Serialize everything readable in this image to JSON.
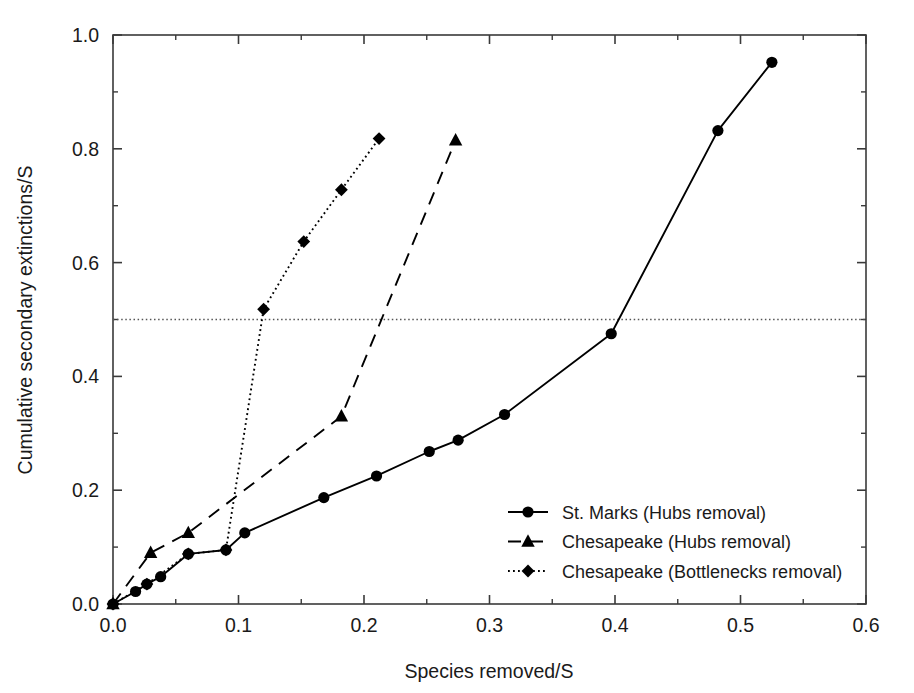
{
  "chart_data": {
    "type": "line",
    "title": "",
    "xlabel": "Species removed/S",
    "ylabel": "Cumulative secondary extinctions/S",
    "xlim": [
      0.0,
      0.6
    ],
    "ylim": [
      0.0,
      1.0
    ],
    "xticks": [
      "0.0",
      "0.1",
      "0.2",
      "0.3",
      "0.4",
      "0.5",
      "0.6"
    ],
    "xtick_values": [
      0.0,
      0.1,
      0.2,
      0.3,
      0.4,
      0.5,
      0.6
    ],
    "yticks": [
      "0.0",
      "0.2",
      "0.4",
      "0.6",
      "0.8",
      "1.0"
    ],
    "ytick_values": [
      0.0,
      0.2,
      0.4,
      0.6,
      0.8,
      1.0
    ],
    "grid": false,
    "legend_position": "lower-right-inside",
    "reference_lines": [
      {
        "name": "half-extinction-threshold",
        "orientation": "horizontal",
        "value": 0.5,
        "style": "dotted"
      }
    ],
    "series": [
      {
        "name": "St. Marks (Hubs removal)",
        "marker": "circle",
        "linestyle": "solid",
        "color": "#000000",
        "points": [
          [
            0.0,
            0.0
          ],
          [
            0.018,
            0.022
          ],
          [
            0.027,
            0.035
          ],
          [
            0.038,
            0.048
          ],
          [
            0.06,
            0.088
          ],
          [
            0.09,
            0.095
          ],
          [
            0.105,
            0.125
          ],
          [
            0.168,
            0.187
          ],
          [
            0.21,
            0.225
          ],
          [
            0.252,
            0.268
          ],
          [
            0.275,
            0.288
          ],
          [
            0.312,
            0.333
          ],
          [
            0.397,
            0.475
          ],
          [
            0.482,
            0.832
          ],
          [
            0.525,
            0.952
          ]
        ]
      },
      {
        "name": "Chesapeake (Hubs removal)",
        "marker": "triangle",
        "linestyle": "dashed",
        "color": "#000000",
        "points": [
          [
            0.0,
            0.0
          ],
          [
            0.03,
            0.09
          ],
          [
            0.06,
            0.125
          ],
          [
            0.182,
            0.33
          ],
          [
            0.273,
            0.815
          ]
        ]
      },
      {
        "name": "Chesapeake (Bottlenecks removal)",
        "marker": "diamond",
        "linestyle": "dotted",
        "color": "#000000",
        "points": [
          [
            0.0,
            0.0
          ],
          [
            0.027,
            0.035
          ],
          [
            0.06,
            0.088
          ],
          [
            0.09,
            0.095
          ],
          [
            0.12,
            0.518
          ],
          [
            0.152,
            0.637
          ],
          [
            0.182,
            0.728
          ],
          [
            0.212,
            0.818
          ]
        ]
      }
    ],
    "legend": [
      {
        "label": "St. Marks (Hubs removal)",
        "marker": "circle",
        "linestyle": "solid"
      },
      {
        "label": "Chesapeake (Hubs removal)",
        "marker": "triangle",
        "linestyle": "dashed"
      },
      {
        "label": "Chesapeake (Bottlenecks removal)",
        "marker": "diamond",
        "linestyle": "dotted"
      }
    ]
  }
}
